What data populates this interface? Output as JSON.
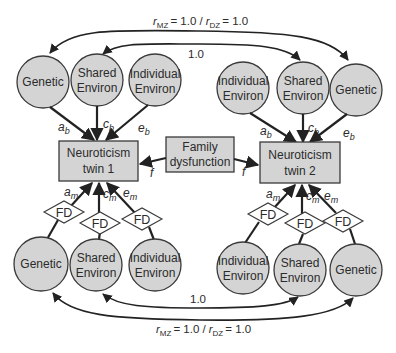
{
  "diagram": {
    "type": "twin-model path diagram",
    "top_correlations": {
      "outer": {
        "r_mz_symbol": "r",
        "r_mz_sub": "MZ",
        "r_mz_value": "= 1.0 /",
        "r_dz_symbol": "r",
        "r_dz_sub": "DZ",
        "r_dz_value": "= 1.0"
      },
      "inner": {
        "value": "1.0"
      }
    },
    "bottom_correlations": {
      "inner": {
        "value": "1.0"
      },
      "outer": {
        "r_mz_symbol": "r",
        "r_mz_sub": "MZ",
        "r_mz_value": "= 1.0 /",
        "r_dz_symbol": "r",
        "r_dz_sub": "DZ",
        "r_dz_value": "= 1.0"
      }
    },
    "twin1": {
      "box": {
        "line1": "Neuroticism",
        "line2": "twin 1"
      },
      "top_factors": [
        {
          "line1": "Genetic",
          "line2": ""
        },
        {
          "line1": "Shared",
          "line2": "Environ"
        },
        {
          "line1": "Individual",
          "line2": "Environ"
        }
      ],
      "bottom_factors": [
        {
          "line1": "Genetic",
          "line2": ""
        },
        {
          "line1": "Shared",
          "line2": "Environ"
        },
        {
          "line1": "Individual",
          "line2": "Environ"
        }
      ],
      "paths_top": [
        {
          "letter": "a",
          "sub": "b"
        },
        {
          "letter": "c",
          "sub": "b"
        },
        {
          "letter": "e",
          "sub": "b"
        }
      ],
      "paths_bottom": [
        {
          "letter": "a",
          "sub": "m"
        },
        {
          "letter": "c",
          "sub": "m"
        },
        {
          "letter": "e",
          "sub": "m"
        }
      ],
      "moderators": [
        "FD",
        "FD",
        "FD"
      ]
    },
    "twin2": {
      "box": {
        "line1": "Neuroticism",
        "line2": "twin 2"
      },
      "top_factors": [
        {
          "line1": "Individual",
          "line2": "Environ"
        },
        {
          "line1": "Shared",
          "line2": "Environ"
        },
        {
          "line1": "Genetic",
          "line2": ""
        }
      ],
      "bottom_factors": [
        {
          "line1": "Individual",
          "line2": "Environ"
        },
        {
          "line1": "Shared",
          "line2": "Environ"
        },
        {
          "line1": "Genetic",
          "line2": ""
        }
      ],
      "paths_top": [
        {
          "letter": "a",
          "sub": "b"
        },
        {
          "letter": "c",
          "sub": "b"
        },
        {
          "letter": "e",
          "sub": "b"
        }
      ],
      "paths_bottom": [
        {
          "letter": "a",
          "sub": "m"
        },
        {
          "letter": "c",
          "sub": "m"
        },
        {
          "letter": "e",
          "sub": "m"
        }
      ],
      "moderators": [
        "FD",
        "FD",
        "FD"
      ]
    },
    "family": {
      "box": {
        "line1": "Family",
        "line2": "dysfunction"
      },
      "path_left": "f",
      "path_right": "f"
    },
    "colors": {
      "node_fill": "#d4d4d4",
      "stroke": "#3a3a3a",
      "text": "#2b2b2b",
      "background": "#ffffff"
    }
  }
}
